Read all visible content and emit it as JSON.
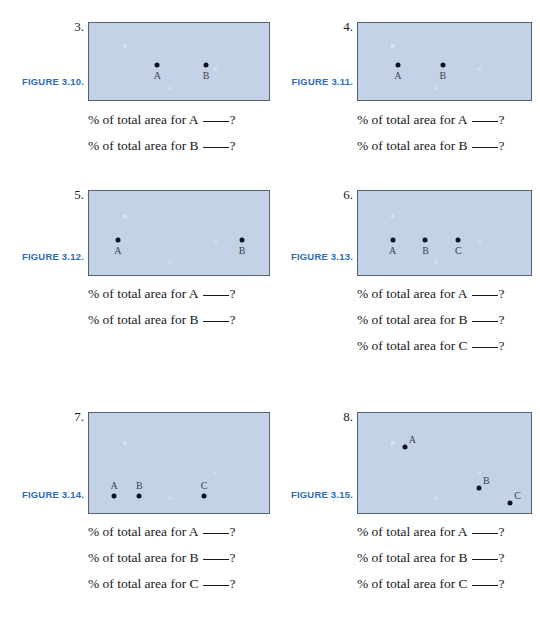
{
  "page": {
    "background": "#ffffff",
    "box_fill": "#c4d2e8",
    "box_border": "#55606e",
    "caption_color": "#2b6cb8",
    "dot_color": "#10131a",
    "text_color": "#16181d"
  },
  "question_template": {
    "prefix": "% of total area for",
    "suffix": "?"
  },
  "exercises": [
    {
      "number": "3.",
      "caption": "FIGURE 3.10.",
      "label_position": "below",
      "points": [
        {
          "label": "A",
          "x": 38,
          "y": 55
        },
        {
          "label": "B",
          "x": 65,
          "y": 55
        }
      ],
      "questions": [
        {
          "prefix": "% of total area for",
          "letter": "A",
          "suffix": "?"
        },
        {
          "prefix": "% of total area for",
          "letter": "B",
          "suffix": "?"
        }
      ]
    },
    {
      "number": "4.",
      "caption": "FIGURE 3.11.",
      "label_position": "below",
      "points": [
        {
          "label": "A",
          "x": 23,
          "y": 55
        },
        {
          "label": "B",
          "x": 49,
          "y": 55
        }
      ],
      "questions": [
        {
          "prefix": "% of total area for",
          "letter": "A",
          "suffix": "?"
        },
        {
          "prefix": "% of total area for",
          "letter": "B",
          "suffix": "?"
        }
      ]
    },
    {
      "number": "5.",
      "caption": "FIGURE 3.12.",
      "label_position": "below",
      "points": [
        {
          "label": "A",
          "x": 16,
          "y": 58
        },
        {
          "label": "B",
          "x": 85,
          "y": 58
        }
      ],
      "questions": [
        {
          "prefix": "% of total area for",
          "letter": "A",
          "suffix": "?"
        },
        {
          "prefix": "% of total area for",
          "letter": "B",
          "suffix": "?"
        }
      ]
    },
    {
      "number": "6.",
      "caption": "FIGURE 3.13.",
      "label_position": "below",
      "points": [
        {
          "label": "A",
          "x": 20,
          "y": 58
        },
        {
          "label": "B",
          "x": 39,
          "y": 58
        },
        {
          "label": "C",
          "x": 58,
          "y": 58
        }
      ],
      "questions": [
        {
          "prefix": "% of total area for",
          "letter": "A",
          "suffix": "?"
        },
        {
          "prefix": "% of total area for",
          "letter": "B",
          "suffix": "?"
        },
        {
          "prefix": "% of total area for",
          "letter": "C",
          "suffix": "?"
        }
      ]
    },
    {
      "number": "7.",
      "caption": "FIGURE 3.14.",
      "label_position": "above",
      "points": [
        {
          "label": "A",
          "x": 14,
          "y": 83
        },
        {
          "label": "B",
          "x": 28,
          "y": 83
        },
        {
          "label": "C",
          "x": 64,
          "y": 83
        }
      ],
      "questions": [
        {
          "prefix": "% of total area for",
          "letter": "A",
          "suffix": "?"
        },
        {
          "prefix": "% of total area for",
          "letter": "B",
          "suffix": "?"
        },
        {
          "prefix": "% of total area for",
          "letter": "C",
          "suffix": "?"
        }
      ]
    },
    {
      "number": "8.",
      "caption": "FIGURE 3.15.",
      "label_position": "upright",
      "points": [
        {
          "label": "A",
          "x": 27,
          "y": 34
        },
        {
          "label": "B",
          "x": 70,
          "y": 75
        },
        {
          "label": "C",
          "x": 88,
          "y": 90
        }
      ],
      "questions": [
        {
          "prefix": "% of total area for",
          "letter": "A",
          "suffix": "?"
        },
        {
          "prefix": "% of total area for",
          "letter": "B",
          "suffix": "?"
        },
        {
          "prefix": "% of total area for",
          "letter": "C",
          "suffix": "?"
        }
      ]
    }
  ]
}
